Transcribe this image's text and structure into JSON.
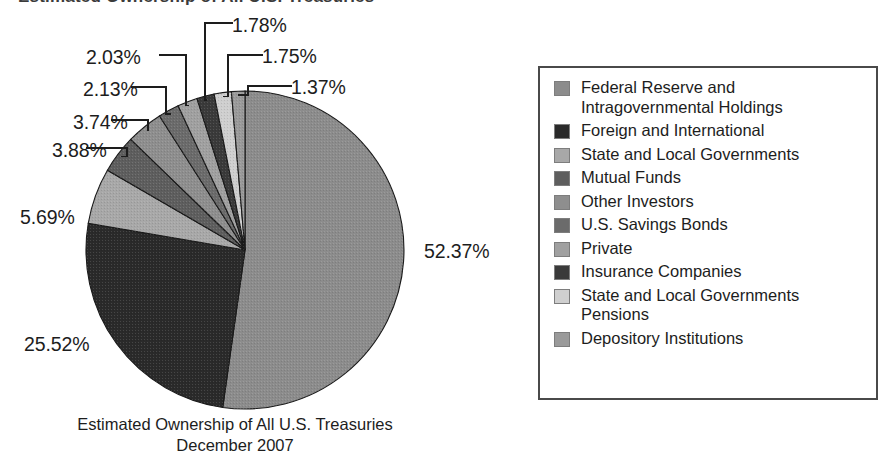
{
  "header": {
    "clipped_title": "Estimated Ownership of All U.S. Treasuries"
  },
  "caption": {
    "line1": "Estimated Ownership of All U.S. Treasuries",
    "line2": "December 2007"
  },
  "legend": {
    "items": [
      {
        "label": "Federal Reserve and\nIntragovernmental Holdings",
        "color": "#8c8c8c"
      },
      {
        "label": "Foreign and International",
        "color": "#2a2a2a"
      },
      {
        "label": "State and Local Governments",
        "color": "#a8a8a8"
      },
      {
        "label": "Mutual Funds",
        "color": "#5e5e5e"
      },
      {
        "label": "Other Investors",
        "color": "#8e8e8e"
      },
      {
        "label": "U.S. Savings Bonds",
        "color": "#6b6b6b"
      },
      {
        "label": "Private",
        "color": "#a0a0a0"
      },
      {
        "label": "Insurance Companies",
        "color": "#3a3a3a"
      },
      {
        "label": "State and Local Governments\nPensions",
        "color": "#cfcfcf"
      },
      {
        "label": "Depository Institutions",
        "color": "#9a9a9a"
      }
    ]
  },
  "chart_data": {
    "type": "pie",
    "title": "Estimated Ownership of All U.S. Treasuries",
    "subtitle": "December 2007",
    "xlabel": "",
    "ylabel": "",
    "legend_position": "right",
    "grid": false,
    "start_angle_deg": 0,
    "direction": "clockwise",
    "units": "percent",
    "categories": [
      "Federal Reserve and Intragovernmental Holdings",
      "Foreign and International",
      "State and Local Governments",
      "Mutual Funds",
      "Other Investors",
      "U.S. Savings Bonds",
      "Private",
      "Insurance Companies",
      "State and Local Governments Pensions",
      "Depository Institutions"
    ],
    "values": [
      52.37,
      25.52,
      5.69,
      3.88,
      3.74,
      2.13,
      2.03,
      1.78,
      1.75,
      1.37
    ],
    "labels": [
      "52.37%",
      "25.52%",
      "5.69%",
      "3.88%",
      "3.74%",
      "2.13%",
      "2.03%",
      "1.78%",
      "1.75%",
      "1.37%"
    ],
    "colors": [
      "#8c8c8c",
      "#2a2a2a",
      "#a8a8a8",
      "#5e5e5e",
      "#8e8e8e",
      "#6b6b6b",
      "#a0a0a0",
      "#3a3a3a",
      "#cfcfcf",
      "#9a9a9a"
    ],
    "total": 100.26
  },
  "pie_labels": [
    {
      "text": "52.37%",
      "x": 424,
      "y": 240
    },
    {
      "text": "25.52%",
      "x": 24,
      "y": 333
    },
    {
      "text": "5.69%",
      "x": 20,
      "y": 206
    },
    {
      "text": "3.88%",
      "x": 52,
      "y": 139
    },
    {
      "text": "3.74%",
      "x": 73,
      "y": 111
    },
    {
      "text": "2.13%",
      "x": 83,
      "y": 78
    },
    {
      "text": "2.03%",
      "x": 86,
      "y": 46
    },
    {
      "text": "1.78%",
      "x": 232,
      "y": 14
    },
    {
      "text": "1.75%",
      "x": 262,
      "y": 45
    },
    {
      "text": "1.37%",
      "x": 291,
      "y": 76
    }
  ]
}
